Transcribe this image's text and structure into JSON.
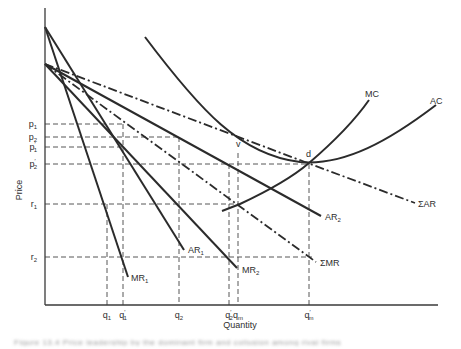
{
  "figure": {
    "axes": {
      "ylabel": "Price",
      "xlabel": "Quantity",
      "origin": [
        45,
        305
      ],
      "y_top": 8,
      "x_right": 438
    },
    "price_levels": [
      {
        "label": "p",
        "sub": "1",
        "prime": false,
        "y": 124,
        "x_end": 123
      },
      {
        "label": "p",
        "sub": "2",
        "prime": false,
        "y": 137,
        "x_end": 179
      },
      {
        "label": "p",
        "sub": "1",
        "prime": true,
        "y": 147,
        "x_end": 123
      },
      {
        "label": "p",
        "sub": "2",
        "prime": true,
        "y": 164,
        "x_end": 309
      },
      {
        "label": "r",
        "sub": "1",
        "prime": false,
        "y": 204,
        "x_end": 240
      },
      {
        "label": "r",
        "sub": "2",
        "prime": false,
        "y": 257,
        "x_end": 312
      }
    ],
    "quantity_levels": [
      {
        "label": "q",
        "sub": "1",
        "prime": false,
        "x": 107,
        "y_top": 204
      },
      {
        "label": "q",
        "sub": "1",
        "prime": true,
        "x": 123,
        "y_top": 124
      },
      {
        "label": "q",
        "sub": "2",
        "prime": false,
        "x": 179,
        "y_top": 137
      },
      {
        "label": "q",
        "sub": "2",
        "prime": true,
        "x": 229,
        "y_top": 164
      },
      {
        "label": "q",
        "sub": "m",
        "prime": false,
        "x": 238,
        "y_top": 153
      },
      {
        "label": "q",
        "sub": "m",
        "prime": true,
        "x": 309,
        "y_top": 164
      }
    ],
    "curves": [
      {
        "name": "MR",
        "sub": "1",
        "style": "solid",
        "path": "M45,27 L128,277",
        "label_x": 131,
        "label_y": 281
      },
      {
        "name": "AR",
        "sub": "1",
        "style": "solid",
        "path": "M45,27 L184,250",
        "label_x": 188,
        "label_y": 253
      },
      {
        "name": "MR",
        "sub": "2",
        "style": "solid",
        "path": "M45,64 L237,268",
        "label_x": 242,
        "label_y": 273
      },
      {
        "name": "AR",
        "sub": "2",
        "style": "solid",
        "path": "M45,64 L321,216",
        "label_x": 325,
        "label_y": 220
      },
      {
        "name": "ΣMR",
        "sub": "",
        "style": "dashdot",
        "path": "M45,64 L316,262",
        "label_x": 320,
        "label_y": 266
      },
      {
        "name": "ΣAR",
        "sub": "",
        "style": "dashdot",
        "path": "M45,64 Q140,100 305,162 L415,203",
        "label_x": 418,
        "label_y": 207
      },
      {
        "name": "AC",
        "sub": "",
        "style": "solid",
        "path": "M145,37 C200,110 240,155 300,162 C345,166 390,140 436,105",
        "label_x": 430,
        "label_y": 104
      },
      {
        "name": "MC",
        "sub": "",
        "style": "solid",
        "path": "M222,211 L240,204 C270,190 295,175 309,163 C330,145 355,120 369,100",
        "label_x": 365,
        "label_y": 97
      }
    ],
    "points": [
      {
        "label": "v",
        "x": 238,
        "y": 153,
        "label_dx": -2,
        "label_dy": -6
      },
      {
        "label": "d",
        "x": 309,
        "y": 163,
        "label_dx": -3,
        "label_dy": -6
      }
    ],
    "caption": "Figure 13.4  Price leadership by the dominant firm and collusion among rival firms"
  }
}
